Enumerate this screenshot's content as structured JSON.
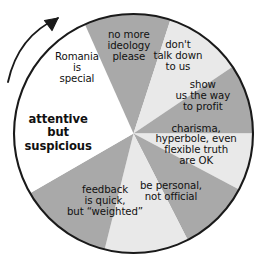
{
  "figure": {
    "name": "communication-wheel-diagram",
    "center_bold_label": "attentive\nbut\nsuspicious",
    "arrow": {
      "name": "clockwise-arrow-icon",
      "direction": "clockwise"
    },
    "colors": {
      "dark_gray": "#a9a9a9",
      "light_gray": "#e9e9e9",
      "white": "#ffffff",
      "outline": "#1a1a1a",
      "text": "#111111"
    },
    "segments": [
      {
        "id": "attentive-but-suspicious",
        "label": "attentive\nbut\nsuspicious",
        "fill": "white",
        "bold": true,
        "start_angle": 196,
        "end_angle": 246,
        "label_x": 58,
        "label_y": 133
      },
      {
        "id": "romania-is-special",
        "label": "Romania\nis\nspecial",
        "fill": "dark_gray",
        "bold": false,
        "start_angle": 246,
        "end_angle": 288,
        "label_x": 77,
        "label_y": 68
      },
      {
        "id": "no-more-ideology-please",
        "label": "no more\nideology\nplease",
        "fill": "light_gray",
        "bold": false,
        "start_angle": 288,
        "end_angle": 326,
        "label_x": 129,
        "label_y": 46
      },
      {
        "id": "dont-talk-down-to-us",
        "label": "don't\ntalk down\nto us",
        "fill": "dark_gray",
        "bold": false,
        "start_angle": 326,
        "end_angle": 360,
        "label_x": 178,
        "label_y": 56
      },
      {
        "id": "show-us-the-way-to-profit",
        "label": "show\nus the way\nto profit",
        "fill": "light_gray",
        "bold": false,
        "start_angle": 0,
        "end_angle": 28,
        "label_x": 203,
        "label_y": 96
      },
      {
        "id": "charisma-hyperbole-flexible-truth",
        "label": "charisma,\nhyperbole, even\nflexible truth\nare OK",
        "fill": "dark_gray",
        "bold": false,
        "start_angle": 28,
        "end_angle": 63,
        "label_x": 196,
        "label_y": 145
      },
      {
        "id": "be-personal-not-official",
        "label": "be personal,\nnot official",
        "fill": "light_gray",
        "bold": false,
        "start_angle": 63,
        "end_angle": 104,
        "label_x": 171,
        "label_y": 192
      },
      {
        "id": "feedback-is-quick-but-weighted",
        "label": "feedback\nis quick,\nbut “weighted”",
        "fill": "dark_gray",
        "bold": false,
        "start_angle": 104,
        "end_angle": 150,
        "label_x": 105,
        "label_y": 201
      },
      {
        "id": "white-lower-left-wedge",
        "label": "",
        "fill": "white",
        "bold": false,
        "start_angle": 150,
        "end_angle": 196,
        "label_x": 0,
        "label_y": 0
      }
    ]
  }
}
